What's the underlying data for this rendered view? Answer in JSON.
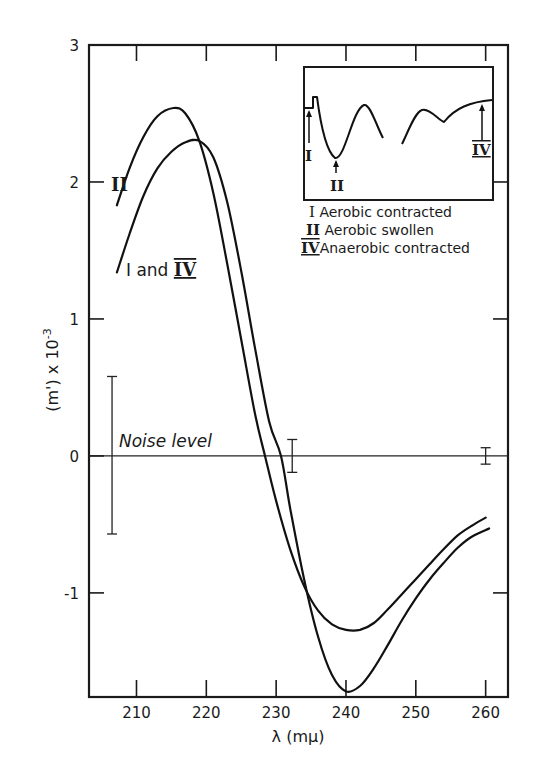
{
  "chart_data": {
    "type": "line",
    "title": "",
    "xlabel": "λ (mμ)",
    "ylabel": "(m') x 10⁻³",
    "xlim": [
      203.2,
      263.2
    ],
    "ylim": [
      -1.76,
      3.0
    ],
    "grid": false,
    "x_ticks": [
      210,
      220,
      230,
      240,
      250,
      260
    ],
    "x_tick_labels": [
      "210",
      "220",
      "230",
      "240",
      "250",
      "260"
    ],
    "y_ticks": [
      -1,
      0,
      1,
      2,
      3
    ],
    "y_tick_labels": [
      "-1",
      "0",
      "1",
      "2",
      "3"
    ],
    "series": [
      {
        "name": "II",
        "label": "II",
        "description": "Aerobic swollen",
        "x": [
          207.2,
          209,
          211,
          213,
          215.3,
          217,
          219,
          221,
          223,
          225,
          227,
          228.4,
          230,
          232,
          234,
          236,
          238,
          240,
          242,
          244,
          246,
          248,
          250,
          252,
          254,
          256,
          258,
          260
        ],
        "y": [
          1.83,
          2.1,
          2.33,
          2.48,
          2.54,
          2.5,
          2.3,
          1.92,
          1.4,
          0.85,
          0.3,
          0.0,
          -0.33,
          -0.68,
          -0.95,
          -1.13,
          -1.23,
          -1.27,
          -1.27,
          -1.22,
          -1.12,
          -1.01,
          -0.9,
          -0.79,
          -0.68,
          -0.58,
          -0.51,
          -0.45
        ]
      },
      {
        "name": "I and IV",
        "label": "I and IV",
        "description": "Aerobic contracted / Anaerobic contracted",
        "x": [
          207.2,
          209,
          211,
          213,
          215,
          217,
          219,
          221,
          223,
          225,
          227,
          229,
          230.7,
          232,
          234,
          236,
          238,
          240,
          242,
          244,
          246,
          248,
          250,
          252,
          254,
          256,
          258,
          260.5
        ],
        "y": [
          1.34,
          1.62,
          1.9,
          2.1,
          2.22,
          2.29,
          2.3,
          2.18,
          1.85,
          1.35,
          0.78,
          0.25,
          0.0,
          -0.38,
          -0.9,
          -1.32,
          -1.6,
          -1.72,
          -1.68,
          -1.55,
          -1.38,
          -1.2,
          -1.04,
          -0.9,
          -0.78,
          -0.67,
          -0.59,
          -0.53
        ]
      }
    ],
    "noise_level": {
      "label": "Noise level",
      "baseline": 0,
      "error_bars": [
        {
          "x": 206.5,
          "upper": 0.58,
          "lower": -0.57
        },
        {
          "x": 232.3,
          "upper": 0.12,
          "lower": -0.12
        },
        {
          "x": 260.0,
          "upper": 0.06,
          "lower": -0.06
        }
      ]
    },
    "annotations": [
      {
        "text": "II",
        "x": 210.2,
        "y": 2.0
      },
      {
        "text": "I and IV",
        "x": 210.2,
        "y": 1.2
      }
    ],
    "inset": {
      "description": "Schematic spectrum with arrows marking positions of states",
      "arrows": [
        {
          "label": "I",
          "position": "left shoulder"
        },
        {
          "label": "II",
          "position": "first minimum"
        },
        {
          "label": "IV",
          "position": "right end"
        }
      ],
      "legend": [
        {
          "numeral": "I",
          "text": "Aerobic contracted"
        },
        {
          "numeral": "II",
          "text": "Aerobic swollen"
        },
        {
          "numeral": "IV",
          "text": "Anaerobic contracted"
        }
      ]
    }
  },
  "labels": {
    "xlabel": "λ (mμ)",
    "ylabel_main": "(m') x 10",
    "ylabel_exp": "-3",
    "noise": "Noise level",
    "curve_II": "II",
    "curve_I_IV_prefix": "I and ",
    "curve_I_IV_suffix": "IV",
    "inset_I": "I",
    "inset_II": "II",
    "inset_IV": "IV",
    "legend_1_num": "I",
    "legend_1_text": "Aerobic contracted",
    "legend_2_num": "II",
    "legend_2_text": "Aerobic swollen",
    "legend_3_num": "IV",
    "legend_3_text": "Anaerobic contracted"
  }
}
